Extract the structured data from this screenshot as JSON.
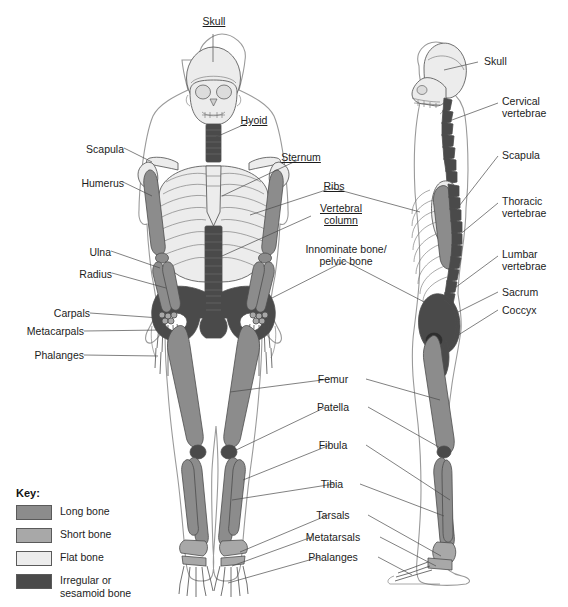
{
  "diagram": {
    "background": "#ffffff"
  },
  "palette": {
    "long_bone": "#8c8c8c",
    "short_bone": "#a8a8a8",
    "flat_bone": "#ececec",
    "irregular_bone": "#4a4a4a",
    "body_outline": "#8a8a8a",
    "bone_outline": "#4d4d4d",
    "leader_line": "#4a4a4a",
    "text": "#1c1c1c"
  },
  "key": {
    "title": "Key:",
    "items": [
      {
        "label": "Long bone",
        "color": "#8c8c8c"
      },
      {
        "label": "Short bone",
        "color": "#a8a8a8"
      },
      {
        "label": "Flat bone",
        "color": "#ececec"
      },
      {
        "label": "Irregular or\nsesamoid bone",
        "color": "#4a4a4a"
      }
    ]
  },
  "labels_left": [
    {
      "text": "Scapula",
      "x": 88,
      "y": 144
    },
    {
      "text": "Humerus",
      "x": 79,
      "y": 178
    },
    {
      "text": "Ulna",
      "x": 86,
      "y": 247
    },
    {
      "text": "Radius",
      "x": 74,
      "y": 269
    },
    {
      "text": "Carpals",
      "x": 47,
      "y": 309
    },
    {
      "text": "Metacarpals",
      "x": 17,
      "y": 327
    },
    {
      "text": "Phalanges",
      "x": 33,
      "y": 351
    }
  ],
  "labels_center_top": [
    {
      "text": "Skull",
      "x": 214,
      "y": 16,
      "underline": true
    },
    {
      "text": "Hyoid",
      "x": 254,
      "y": 115,
      "underline": true
    },
    {
      "text": "Sternum",
      "x": 300,
      "y": 152,
      "underline": true
    },
    {
      "text": "Ribs",
      "x": 334,
      "y": 181,
      "underline": true
    },
    {
      "text": "Vertebral\ncolumn",
      "x": 313,
      "y": 203,
      "underline": true
    },
    {
      "text": "Innominate bone/\npelvic bone",
      "x": 307,
      "y": 246,
      "underline": false
    }
  ],
  "labels_center_bottom": [
    {
      "text": "Femur",
      "x": 334,
      "y": 375
    },
    {
      "text": "Patella",
      "x": 330,
      "y": 403
    },
    {
      "text": "Fibula",
      "x": 334,
      "y": 441
    },
    {
      "text": "Tibia",
      "x": 338,
      "y": 480
    },
    {
      "text": "Tarsals",
      "x": 332,
      "y": 511
    },
    {
      "text": "Metatarsals",
      "x": 316,
      "y": 533
    },
    {
      "text": "Phalanges",
      "x": 324,
      "y": 553
    }
  ],
  "labels_right": [
    {
      "text": "Skull",
      "x": 484,
      "y": 58
    },
    {
      "text": "Cervical\nvertebrae",
      "x": 503,
      "y": 97
    },
    {
      "text": "Scapula",
      "x": 505,
      "y": 152
    },
    {
      "text": "Thoracic\nvertebrae",
      "x": 505,
      "y": 197
    },
    {
      "text": "Lumbar\nvertebrae",
      "x": 505,
      "y": 250
    },
    {
      "text": "Sacrum",
      "x": 505,
      "y": 288
    },
    {
      "text": "Coccyx",
      "x": 505,
      "y": 306
    }
  ],
  "bone_groups": {
    "long": [
      "Humerus",
      "Radius",
      "Ulna",
      "Femur",
      "Tibia",
      "Fibula",
      "Metacarpals",
      "Metatarsals",
      "Phalanges"
    ],
    "short": [
      "Carpals",
      "Tarsals"
    ],
    "flat": [
      "Skull",
      "Scapula",
      "Sternum",
      "Ribs"
    ],
    "irregular_sesamoid": [
      "Vertebral column",
      "Cervical vertebrae",
      "Thoracic vertebrae",
      "Lumbar vertebrae",
      "Sacrum",
      "Coccyx",
      "Hyoid",
      "Innominate bone/pelvic bone",
      "Patella"
    ]
  }
}
